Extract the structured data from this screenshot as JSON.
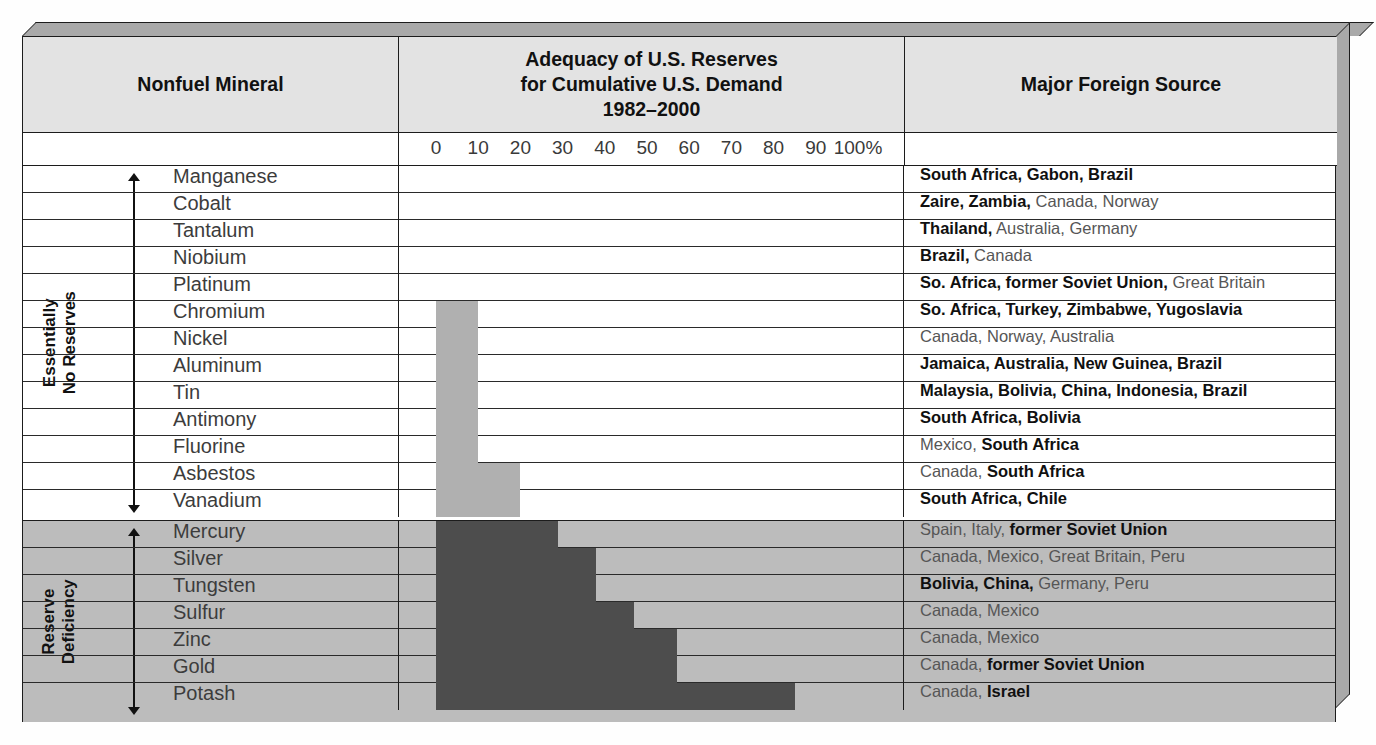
{
  "table": {
    "headers": {
      "mineral": "Nonfuel Mineral",
      "chart_line1": "Adequacy of U.S. Reserves",
      "chart_line2": "for Cumulative U.S. Demand",
      "chart_line3": "1982–2000",
      "source": "Major Foreign Source"
    },
    "axis_ticks": [
      "0",
      "10",
      "20",
      "30",
      "40",
      "50",
      "60",
      "70",
      "80",
      "90",
      "100%"
    ],
    "groups": [
      {
        "id": "essentially-no-reserves",
        "label_line1": "Essentially",
        "label_line2": "No Reserves"
      },
      {
        "id": "reserve-deficiency",
        "label_line1": "Reserve",
        "label_line2": "Deficiency"
      }
    ]
  },
  "colors": {
    "bar_light": "#b0b0b0",
    "bar_dark": "#4d4d4d",
    "header_fill": "#e3e3e3",
    "group_bottom_fill": "#bcbcbc",
    "bevel": "#a9a9a9",
    "rule": "#1c1c1c"
  },
  "chart_data": {
    "type": "bar",
    "title": "Adequacy of U.S. Reserves for Cumulative U.S. Demand 1982–2000",
    "xlabel": "Percent of cumulative U.S. demand met by U.S. reserves",
    "ylabel": "Nonfuel Mineral",
    "xlim": [
      0,
      100
    ],
    "xticks": [
      0,
      10,
      20,
      30,
      40,
      50,
      60,
      70,
      80,
      90,
      100
    ],
    "grid": false,
    "legend": "none",
    "orientation": "horizontal",
    "categories": [
      "Manganese",
      "Cobalt",
      "Tantalum",
      "Niobium",
      "Platinum",
      "Chromium",
      "Nickel",
      "Aluminum",
      "Tin",
      "Antimony",
      "Fluorine",
      "Asbestos",
      "Vanadium",
      "Mercury",
      "Silver",
      "Tungsten",
      "Sulfur",
      "Zinc",
      "Gold",
      "Potash"
    ],
    "values": [
      0,
      0,
      0,
      0,
      0,
      10,
      10,
      10,
      10,
      10,
      10,
      20,
      20,
      29,
      38,
      38,
      47,
      57,
      57,
      85
    ]
  },
  "rows": [
    {
      "mineral": "Manganese",
      "value": 0,
      "group": 0,
      "source_html": "<b>South Africa, Gabon, Brazil</b>"
    },
    {
      "mineral": "Cobalt",
      "value": 0,
      "group": 0,
      "source_html": "<b>Zaire, Zambia,</b> Canada, Norway"
    },
    {
      "mineral": "Tantalum",
      "value": 0,
      "group": 0,
      "source_html": "<b>Thailand,</b> Australia, Germany"
    },
    {
      "mineral": "Niobium",
      "value": 0,
      "group": 0,
      "source_html": "<b>Brazil,</b> Canada"
    },
    {
      "mineral": "Platinum",
      "value": 0,
      "group": 0,
      "source_html": "<b>So. Africa, former Soviet Union,</b> Great Britain"
    },
    {
      "mineral": "Chromium",
      "value": 10,
      "group": 0,
      "source_html": "<b>So. Africa, Turkey, Zimbabwe, Yugoslavia</b>"
    },
    {
      "mineral": "Nickel",
      "value": 10,
      "group": 0,
      "source_html": "Canada, Norway, Australia"
    },
    {
      "mineral": "Aluminum",
      "value": 10,
      "group": 0,
      "source_html": "<b>Jamaica, Australia, New Guinea, Brazil</b>"
    },
    {
      "mineral": "Tin",
      "value": 10,
      "group": 0,
      "source_html": "<b>Malaysia, Bolivia, China, Indonesia, Brazil</b>"
    },
    {
      "mineral": "Antimony",
      "value": 10,
      "group": 0,
      "source_html": "<b>South Africa, Bolivia</b>"
    },
    {
      "mineral": "Fluorine",
      "value": 10,
      "group": 0,
      "source_html": "Mexico, <b>South Africa</b>"
    },
    {
      "mineral": "Asbestos",
      "value": 20,
      "group": 0,
      "source_html": "Canada, <b>South Africa</b>"
    },
    {
      "mineral": "Vanadium",
      "value": 20,
      "group": 0,
      "source_html": "<b>South Africa, Chile</b>"
    },
    {
      "mineral": "Mercury",
      "value": 29,
      "group": 1,
      "source_html": "Spain, Italy, <b>former Soviet Union</b>"
    },
    {
      "mineral": "Silver",
      "value": 38,
      "group": 1,
      "source_html": "Canada, Mexico, Great Britain, Peru"
    },
    {
      "mineral": "Tungsten",
      "value": 38,
      "group": 1,
      "source_html": "<b>Bolivia, China,</b> Germany, Peru"
    },
    {
      "mineral": "Sulfur",
      "value": 47,
      "group": 1,
      "source_html": "Canada, Mexico"
    },
    {
      "mineral": "Zinc",
      "value": 57,
      "group": 1,
      "source_html": "Canada, Mexico"
    },
    {
      "mineral": "Gold",
      "value": 57,
      "group": 1,
      "source_html": "Canada, <b>former Soviet Union</b>"
    },
    {
      "mineral": "Potash",
      "value": 85,
      "group": 1,
      "source_html": "Canada, <b>Israel</b>"
    }
  ]
}
